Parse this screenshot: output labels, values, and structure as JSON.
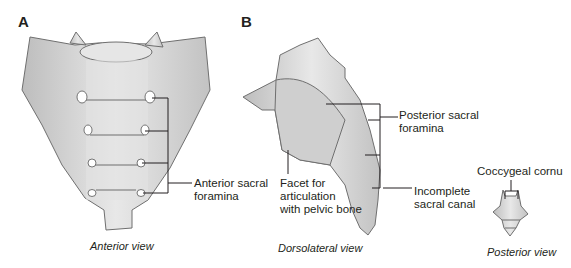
{
  "panels": {
    "a": {
      "letter": "A",
      "caption": "Anterior view"
    },
    "b": {
      "letter": "B",
      "caption_dorsolateral": "Dorsolateral view",
      "caption_posterior": "Posterior view"
    }
  },
  "labels": {
    "anterior_foramina": "Anterior sacral\nforamina",
    "posterior_foramina": "Posterior sacral\nforamina",
    "facet": "Facet for\narticulation\nwith pelvic bone",
    "incomplete_canal": "Incomplete\nsacral canal",
    "coccygeal_cornu": "Coccygeal cornu"
  },
  "colors": {
    "bone_fill": "#dcdcdc",
    "bone_stroke": "#777777",
    "leader": "#231f20"
  }
}
